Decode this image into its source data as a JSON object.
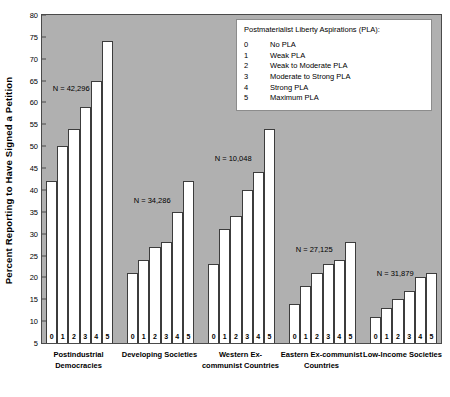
{
  "chart_data": {
    "type": "bar",
    "title": "",
    "xlabel": "",
    "ylabel": "Percent Reporting to Have Signed a Petition",
    "ylim": [
      5,
      80
    ],
    "ytick_step": 5,
    "yticks": [
      10,
      15,
      20,
      25,
      30,
      35,
      40,
      45,
      50,
      55,
      60,
      65,
      70,
      75,
      80
    ],
    "grid": false,
    "legend_position": "top-right",
    "categories": [
      "0",
      "1",
      "2",
      "3",
      "4",
      "5"
    ],
    "groups": [
      {
        "name": "Postindustrial Democracies",
        "caption_lines": [
          "Postindustrial",
          "Democracies"
        ],
        "n_label": "N = 42,296",
        "values": [
          42,
          50,
          54,
          59,
          65,
          74
        ]
      },
      {
        "name": "Developing Societies",
        "caption_lines": [
          "Developing Societies"
        ],
        "n_label": "N = 34,286",
        "values": [
          21,
          24,
          27,
          28,
          35,
          42
        ]
      },
      {
        "name": "Western Ex-communist Countries",
        "caption_lines": [
          "Western Ex-",
          "communist Countries"
        ],
        "n_label": "N = 10,048",
        "values": [
          23,
          31,
          34,
          40,
          44,
          54
        ]
      },
      {
        "name": "Eastern Ex-communist Countries",
        "caption_lines": [
          "Eastern Ex-communist",
          "Countries"
        ],
        "n_label": "N = 27,125",
        "values": [
          14,
          18,
          21,
          23,
          24,
          28
        ]
      },
      {
        "name": "Low-Income Societies",
        "caption_lines": [
          "Low-Income Societies"
        ],
        "n_label": "N = 31,879",
        "values": [
          11,
          13,
          15,
          17,
          20,
          21
        ]
      }
    ],
    "legend": {
      "title": "Postmaterialist Liberty Aspirations (PLA):",
      "entries": [
        {
          "code": "0",
          "label": "No PLA"
        },
        {
          "code": "1",
          "label": "Weak PLA"
        },
        {
          "code": "2",
          "label": "Weak to Moderate PLA"
        },
        {
          "code": "3",
          "label": "Moderate to Strong PLA"
        },
        {
          "code": "4",
          "label": "Strong PLA"
        },
        {
          "code": "5",
          "label": "Maximum PLA"
        }
      ]
    },
    "colors": {
      "plot_background": "#b0b0b0",
      "bar_fill": "#ffffff",
      "bar_outline": "#3c3c3c",
      "axis": "#4a4a4a",
      "page_background": "#ffffff"
    }
  }
}
